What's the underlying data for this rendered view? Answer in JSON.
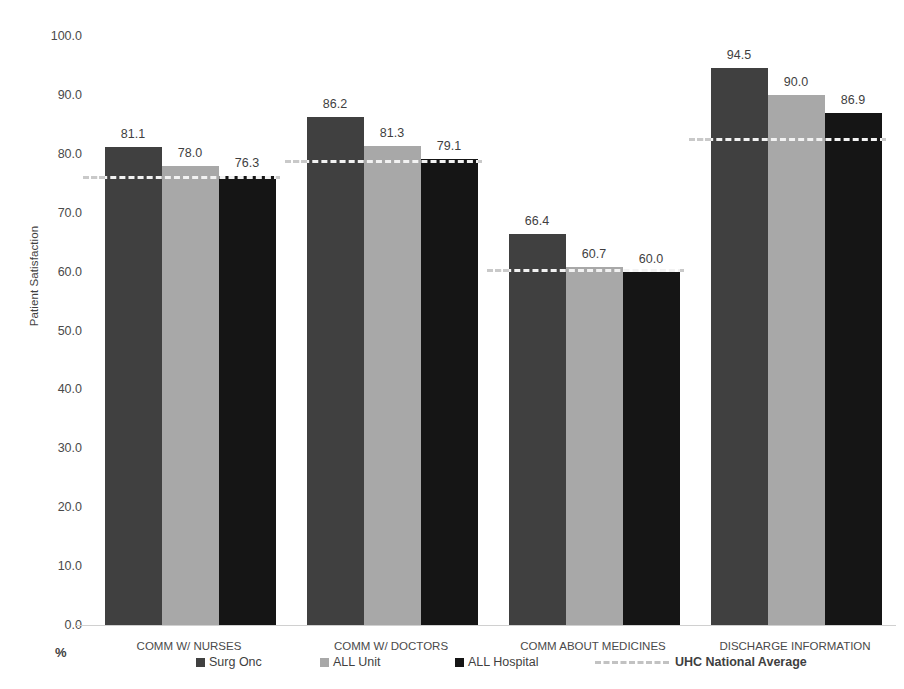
{
  "chart_data": {
    "type": "bar",
    "title": "",
    "xlabel": "",
    "ylabel": "Patient Satisfaction",
    "unit_label": "%",
    "ylim": [
      0,
      100
    ],
    "ytick_step": 10,
    "ytick_labels": [
      "100.0",
      "90.0",
      "80.0",
      "70.0",
      "60.0",
      "50.0",
      "40.0",
      "30.0",
      "20.0",
      "10.0",
      "0.0"
    ],
    "ytick_values": [
      100,
      90,
      80,
      70,
      60,
      50,
      40,
      30,
      20,
      10,
      0
    ],
    "grid": false,
    "legend_position": "bottom",
    "categories": [
      "COMM W/ NURSES",
      "COMM W/ DOCTORS",
      "COMM ABOUT MEDICINES",
      "DISCHARGE INFORMATION"
    ],
    "series": [
      {
        "name": "Surg Onc",
        "color": "#404040",
        "values": [
          81.1,
          86.2,
          66.4,
          94.5
        ],
        "labels": [
          "81.1",
          "86.2",
          "66.4",
          "94.5"
        ]
      },
      {
        "name": "ALL Unit",
        "color": "#a8a8a8",
        "values": [
          78.0,
          81.3,
          60.7,
          90.0
        ],
        "labels": [
          "78.0",
          "81.3",
          "60.7",
          "90.0"
        ]
      },
      {
        "name": "ALL Hospital",
        "color": "#151515",
        "values": [
          76.3,
          79.1,
          60.0,
          86.9
        ],
        "labels": [
          "76.3",
          "79.1",
          "60.0",
          "86.9"
        ]
      }
    ],
    "reference_line": {
      "name": "UHC National Average",
      "style": "dashed",
      "color": "#f2f2f2",
      "values": [
        76.2,
        79.0,
        60.4,
        82.7
      ]
    }
  },
  "legend": {
    "items": [
      {
        "label": "Surg Onc"
      },
      {
        "label": "ALL Unit"
      },
      {
        "label": "ALL Hospital"
      }
    ],
    "average_label": "UHC National Average"
  }
}
